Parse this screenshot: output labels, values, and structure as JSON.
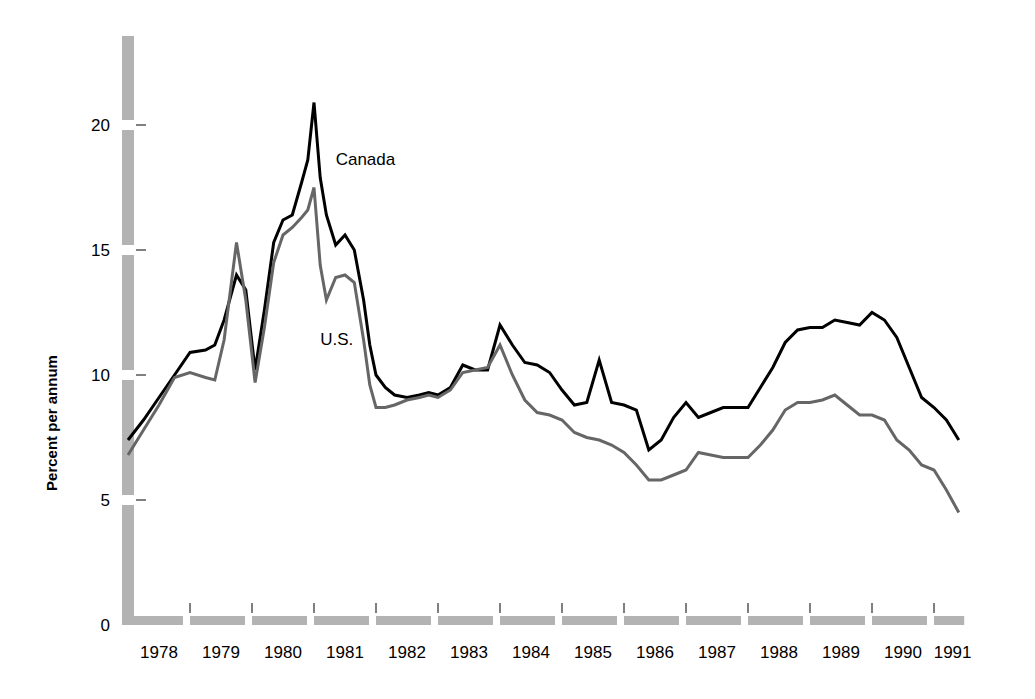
{
  "chart_data": {
    "type": "line",
    "title": "",
    "subtitle": "",
    "xlabel": "",
    "ylabel": "Percent per annum",
    "ylim": [
      0,
      22.5
    ],
    "xlim": [
      1978,
      1991.6
    ],
    "yticks": [
      0,
      5,
      10,
      15,
      20
    ],
    "ytick_labels": [
      "0",
      "5",
      "10",
      "15",
      "20"
    ],
    "xticks": [
      1978,
      1979,
      1980,
      1981,
      1982,
      1983,
      1984,
      1985,
      1986,
      1987,
      1988,
      1989,
      1990,
      1991
    ],
    "xtick_labels": [
      "1978",
      "1979",
      "1980",
      "1981",
      "1982",
      "1983",
      "1984",
      "1985",
      "1986",
      "1987",
      "1988",
      "1989",
      "1990",
      "1991"
    ],
    "grid": false,
    "legend_position": "inline-annotation",
    "annotations": [
      {
        "text": "Canada",
        "x": 1981.35,
        "y": 18.4,
        "series": "Canada"
      },
      {
        "text": "U.S.",
        "x": 1981.1,
        "y": 11.2,
        "series": "U.S."
      }
    ],
    "series": [
      {
        "name": "Canada",
        "color": "#000000",
        "linewidth": 3.0,
        "x": [
          1978.0,
          1978.25,
          1978.5,
          1978.75,
          1979.0,
          1979.25,
          1979.4,
          1979.55,
          1979.75,
          1979.9,
          1980.05,
          1980.2,
          1980.35,
          1980.5,
          1980.65,
          1980.8,
          1980.9,
          1981.0,
          1981.1,
          1981.2,
          1981.35,
          1981.5,
          1981.65,
          1981.8,
          1981.9,
          1982.0,
          1982.15,
          1982.3,
          1982.5,
          1982.7,
          1982.85,
          1983.0,
          1983.2,
          1983.4,
          1983.6,
          1983.8,
          1984.0,
          1984.2,
          1984.4,
          1984.6,
          1984.8,
          1985.0,
          1985.2,
          1985.4,
          1985.6,
          1985.8,
          1986.0,
          1986.2,
          1986.4,
          1986.6,
          1986.8,
          1987.0,
          1987.2,
          1987.4,
          1987.6,
          1987.8,
          1988.0,
          1988.2,
          1988.4,
          1988.6,
          1988.8,
          1989.0,
          1989.2,
          1989.4,
          1989.6,
          1989.8,
          1990.0,
          1990.2,
          1990.4,
          1990.6,
          1990.8,
          1991.0,
          1991.2,
          1991.4
        ],
        "y": [
          7.4,
          8.2,
          9.1,
          10.0,
          10.9,
          11.0,
          11.2,
          12.2,
          14.0,
          13.4,
          10.2,
          12.6,
          15.3,
          16.2,
          16.4,
          17.7,
          18.6,
          20.9,
          17.9,
          16.4,
          15.2,
          15.6,
          15.0,
          13.0,
          11.2,
          10.0,
          9.5,
          9.2,
          9.1,
          9.2,
          9.3,
          9.2,
          9.5,
          10.4,
          10.2,
          10.2,
          12.0,
          11.2,
          10.5,
          10.4,
          10.1,
          9.4,
          8.8,
          8.9,
          10.6,
          8.9,
          8.8,
          8.6,
          7.0,
          7.4,
          8.3,
          8.9,
          8.3,
          8.5,
          8.7,
          8.7,
          8.7,
          9.5,
          10.3,
          11.3,
          11.8,
          11.9,
          11.9,
          12.2,
          12.1,
          12.0,
          12.5,
          12.2,
          11.5,
          10.3,
          9.1,
          8.7,
          8.2,
          7.4
        ]
      },
      {
        "name": "U.S.",
        "color": "#666666",
        "linewidth": 3.0,
        "x": [
          1978.0,
          1978.25,
          1978.5,
          1978.75,
          1979.0,
          1979.25,
          1979.4,
          1979.55,
          1979.75,
          1979.9,
          1980.05,
          1980.2,
          1980.35,
          1980.5,
          1980.65,
          1980.8,
          1980.9,
          1981.0,
          1981.1,
          1981.2,
          1981.35,
          1981.5,
          1981.65,
          1981.8,
          1981.9,
          1982.0,
          1982.15,
          1982.3,
          1982.5,
          1982.7,
          1982.85,
          1983.0,
          1983.2,
          1983.4,
          1983.6,
          1983.8,
          1984.0,
          1984.2,
          1984.4,
          1984.6,
          1984.8,
          1985.0,
          1985.2,
          1985.4,
          1985.6,
          1985.8,
          1986.0,
          1986.2,
          1986.4,
          1986.6,
          1986.8,
          1987.0,
          1987.2,
          1987.4,
          1987.6,
          1987.8,
          1988.0,
          1988.2,
          1988.4,
          1988.6,
          1988.8,
          1989.0,
          1989.2,
          1989.4,
          1989.6,
          1989.8,
          1990.0,
          1990.2,
          1990.4,
          1990.6,
          1990.8,
          1991.0,
          1991.2,
          1991.4
        ],
        "y": [
          6.8,
          7.8,
          8.8,
          9.9,
          10.1,
          9.9,
          9.8,
          11.4,
          15.3,
          13.0,
          9.7,
          11.9,
          14.5,
          15.6,
          15.9,
          16.3,
          16.6,
          17.5,
          14.4,
          13.0,
          13.9,
          14.0,
          13.7,
          11.4,
          9.6,
          8.7,
          8.7,
          8.8,
          9.0,
          9.1,
          9.2,
          9.1,
          9.4,
          10.1,
          10.2,
          10.3,
          11.2,
          10.0,
          9.0,
          8.5,
          8.4,
          8.2,
          7.7,
          7.5,
          7.4,
          7.2,
          6.9,
          6.4,
          5.8,
          5.8,
          6.0,
          6.2,
          6.9,
          6.8,
          6.7,
          6.7,
          6.7,
          7.2,
          7.8,
          8.6,
          8.9,
          8.9,
          9.0,
          9.2,
          8.8,
          8.4,
          8.4,
          8.2,
          7.4,
          7.0,
          6.4,
          6.2,
          5.4,
          4.5
        ]
      }
    ]
  },
  "axis": {
    "y_axis_label": "Percent per annum",
    "axis_bar_color": "#b3b3b3",
    "tick_mark_color": "#808080"
  },
  "series_labels": {
    "canada": "Canada",
    "us": "U.S."
  }
}
